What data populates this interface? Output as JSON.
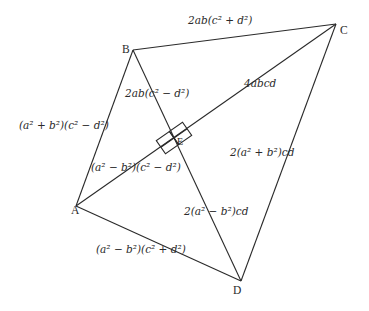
{
  "diagram": {
    "type": "quadrilateral-with-perpendicular-diagonals",
    "vertices": {
      "A": {
        "label": "A",
        "x": 76,
        "y": 206
      },
      "B": {
        "label": "B",
        "x": 133,
        "y": 50
      },
      "C": {
        "label": "C",
        "x": 336,
        "y": 24
      },
      "D": {
        "label": "D",
        "x": 241,
        "y": 281
      },
      "E": {
        "label": "E",
        "x": 174,
        "y": 138
      }
    },
    "edges": [
      {
        "from": "A",
        "to": "B"
      },
      {
        "from": "B",
        "to": "C"
      },
      {
        "from": "C",
        "to": "D"
      },
      {
        "from": "D",
        "to": "A"
      },
      {
        "from": "A",
        "to": "C"
      },
      {
        "from": "B",
        "to": "D"
      }
    ],
    "right_angle_marker": {
      "at": "E"
    },
    "labels": {
      "BC": {
        "pre": "2ab(c",
        "mid": " + d",
        "post": ")"
      },
      "AB": {
        "text": "(a² + b²)(c² − d²)"
      },
      "BE": {
        "text": "2ab(c² − d²)"
      },
      "EC": {
        "text": "4abcd"
      },
      "AE": {
        "text": "(a² − b²)(c² − d²)"
      },
      "CD": {
        "text": "2(a² + b²)cd"
      },
      "ED": {
        "text": "2(a² − b²)cd"
      },
      "AD": {
        "text": "(a² − b²)(c² + d²)"
      }
    },
    "line_color": "#2a2a2a"
  }
}
